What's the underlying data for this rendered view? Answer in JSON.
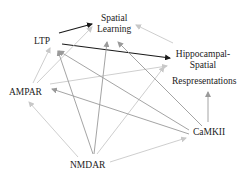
{
  "diagram": {
    "type": "directed-graph",
    "colors": {
      "strong_edge": "#1a1a1a",
      "medium_edge": "#9a9a9a",
      "light_edge": "#c8c8c8",
      "text": "#222222"
    },
    "nodes": [
      {
        "id": "ltp",
        "label": "LTP",
        "x": 45,
        "y": 41
      },
      {
        "id": "spatial_learning",
        "label_line1": "Spatial",
        "label_line2": "Learning",
        "x": 115,
        "y": 24
      },
      {
        "id": "hippocampal",
        "label_line1": "Hippocampal-",
        "label_line2": "Spatial",
        "label_line3": "Respresentations",
        "x": 203,
        "y": 60
      },
      {
        "id": "ampar",
        "label": "AMPAR",
        "x": 26,
        "y": 92
      },
      {
        "id": "camkii",
        "label": "CaMKII",
        "x": 208,
        "y": 132
      },
      {
        "id": "nmdar",
        "label": "NMDAR",
        "x": 85,
        "y": 166
      }
    ],
    "edges": [
      {
        "from": "ltp",
        "to": "spatial_learning",
        "weight": "strong",
        "x1": 59,
        "y1": 33,
        "x2": 92,
        "y2": 24
      },
      {
        "from": "ltp",
        "to": "hippocampal",
        "weight": "strong",
        "x1": 62,
        "y1": 44,
        "x2": 170,
        "y2": 58
      },
      {
        "from": "hippocampal",
        "to": "spatial_learning",
        "weight": "light",
        "x1": 173,
        "y1": 43,
        "x2": 136,
        "y2": 25
      },
      {
        "from": "ampar",
        "to": "ltp",
        "weight": "light",
        "x1": 33,
        "y1": 83,
        "x2": 50,
        "y2": 48
      },
      {
        "from": "ampar",
        "to": "spatial_learning",
        "weight": "light",
        "x1": 37,
        "y1": 83,
        "x2": 92,
        "y2": 27
      },
      {
        "from": "ampar",
        "to": "hippocampal",
        "weight": "light",
        "x1": 50,
        "y1": 84,
        "x2": 167,
        "y2": 66
      },
      {
        "from": "nmdar",
        "to": "ltp",
        "weight": "medium",
        "x1": 93,
        "y1": 154,
        "x2": 58,
        "y2": 51
      },
      {
        "from": "nmdar",
        "to": "spatial_learning",
        "weight": "medium",
        "x1": 94,
        "y1": 154,
        "x2": 107,
        "y2": 42
      },
      {
        "from": "nmdar",
        "to": "hippocampal",
        "weight": "light",
        "x1": 97,
        "y1": 154,
        "x2": 164,
        "y2": 67
      },
      {
        "from": "nmdar",
        "to": "ampar",
        "weight": "light",
        "x1": 78,
        "y1": 157,
        "x2": 29,
        "y2": 102
      },
      {
        "from": "nmdar",
        "to": "camkii",
        "weight": "light",
        "x1": 110,
        "y1": 162,
        "x2": 186,
        "y2": 138
      },
      {
        "from": "camkii",
        "to": "ltp",
        "weight": "medium",
        "x1": 189,
        "y1": 130,
        "x2": 59,
        "y2": 51
      },
      {
        "from": "camkii",
        "to": "ampar",
        "weight": "medium",
        "x1": 189,
        "y1": 134,
        "x2": 52,
        "y2": 89
      },
      {
        "from": "camkii",
        "to": "spatial_learning",
        "weight": "medium",
        "x1": 202,
        "y1": 126,
        "x2": 118,
        "y2": 42
      },
      {
        "from": "camkii",
        "to": "hippocampal",
        "weight": "medium",
        "x1": 208,
        "y1": 122,
        "x2": 208,
        "y2": 92
      }
    ]
  }
}
